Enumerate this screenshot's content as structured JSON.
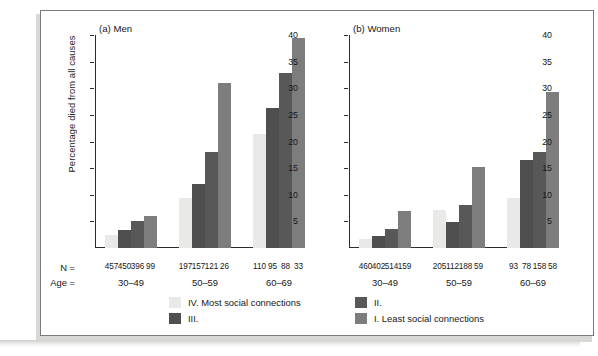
{
  "figure": {
    "y_axis_title": "Percentage died from all causes",
    "n_row_caption": "N =",
    "age_row_caption": "Age ="
  },
  "legend": {
    "items": [
      {
        "label": "IV. Most social connections",
        "color": "#e9e9e7",
        "name": "legend-iv"
      },
      {
        "label": "III.",
        "color": "#4f4f4f",
        "name": "legend-iii"
      },
      {
        "label": "II.",
        "color": "#585858",
        "name": "legend-ii"
      },
      {
        "label": "I. Least social connections",
        "color": "#7d7d7d",
        "name": "legend-i"
      }
    ]
  },
  "chart_data": {
    "type": "bar",
    "xlabel": "Age =",
    "ylabel": "Percentage died from all causes",
    "ylim": [
      0,
      40
    ],
    "yticks": [
      5,
      10,
      15,
      20,
      25,
      30,
      35,
      40
    ],
    "grid": false,
    "legend_position": "bottom",
    "categories": [
      "30-49",
      "50-59",
      "60-69"
    ],
    "series": [
      {
        "name": "IV. Most social connections",
        "color": "#e9e9e7"
      },
      {
        "name": "III.",
        "color": "#4f4f4f"
      },
      {
        "name": "II.",
        "color": "#585858"
      },
      {
        "name": "I. Least social connections",
        "color": "#7d7d7d"
      }
    ],
    "panels": [
      {
        "id": "men",
        "title": "(a) Men",
        "groups": [
          {
            "age": "30-49",
            "values": [
              2.5,
              3.3,
              5.1,
              6.0
            ],
            "n": [
              457,
              450,
              396,
              99
            ]
          },
          {
            "age": "50-59",
            "values": [
              9.4,
              12.1,
              18.0,
              31.0
            ],
            "n": [
              197,
              157,
              121,
              26
            ]
          },
          {
            "age": "60-69",
            "values": [
              21.5,
              26.3,
              32.8,
              39.5
            ],
            "n": [
              110,
              95,
              88,
              33
            ]
          }
        ]
      },
      {
        "id": "women",
        "title": "(b) Women",
        "groups": [
          {
            "age": "30-49",
            "values": [
              1.6,
              2.2,
              3.6,
              7.0
            ],
            "n": [
              460,
              402,
              514,
              159
            ]
          },
          {
            "age": "50-59",
            "values": [
              7.2,
              4.9,
              8.0,
              15.2
            ],
            "n": [
              205,
              112,
              188,
              59
            ]
          },
          {
            "age": "60-69",
            "values": [
              9.4,
              16.6,
              18.0,
              29.3
            ],
            "n": [
              93,
              78,
              158,
              58
            ]
          }
        ]
      }
    ]
  }
}
